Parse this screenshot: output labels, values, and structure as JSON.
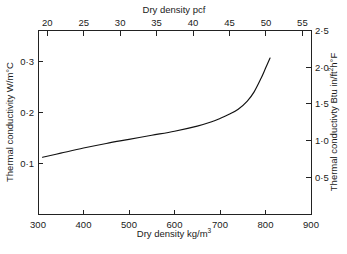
{
  "chart_data": {
    "type": "line",
    "title": "",
    "xlabel": "Dry density kg/m3",
    "ylabel": "Thermal conductivity W/m°C",
    "xlabel_top": "Dry density pcf",
    "ylabel_right": "Thermal conductivty Btu in/ft2h°F",
    "xlim": [
      300,
      900
    ],
    "ylim": [
      0.0,
      0.36
    ],
    "xlim_top": [
      18.73,
      56.18
    ],
    "ylim_right": [
      0.0,
      2.497
    ],
    "grid": false,
    "legend": null,
    "xticks": [
      300,
      400,
      500,
      600,
      700,
      800,
      900
    ],
    "xticklabels": [
      "300",
      "400",
      "500",
      "600",
      "700",
      "800",
      "900"
    ],
    "yticks": [
      0.1,
      0.2,
      0.3
    ],
    "yticklabels": [
      "0·1",
      "0·2",
      "0·3"
    ],
    "xticks_top": [
      20,
      25,
      30,
      35,
      40,
      45,
      50,
      55
    ],
    "xticklabels_top": [
      "20",
      "25",
      "30",
      "35",
      "40",
      "45",
      "50",
      "55"
    ],
    "yticks_right": [
      0.5,
      1.0,
      1.5,
      2.0,
      2.5
    ],
    "yticklabels_right": [
      "0·5",
      "1·0",
      "1·5",
      "2·0",
      "2·5"
    ],
    "series": [
      {
        "name": "thermal conductivity vs dry density",
        "x": [
          310,
          350,
          400,
          450,
          500,
          550,
          600,
          650,
          680,
          700,
          720,
          740,
          760,
          775,
          790,
          800,
          810
        ],
        "values": [
          0.112,
          0.12,
          0.13,
          0.139,
          0.147,
          0.155,
          0.163,
          0.173,
          0.181,
          0.188,
          0.196,
          0.206,
          0.222,
          0.24,
          0.266,
          0.286,
          0.306
        ]
      }
    ]
  },
  "axes": {
    "left_title": "Thermal conductivity W/m°C",
    "bottom_title_main": "Dry density kg/m",
    "bottom_title_sup": "3",
    "top_title": "Dry density pcf",
    "right_title_pre": "Thermal conductivty Btu in/ft",
    "right_title_sup": "2",
    "right_title_post": "h°F"
  },
  "colors": {
    "curve": "#111111",
    "axis": "#222222",
    "background": "#ffffff",
    "text": "#1a1a1a"
  }
}
